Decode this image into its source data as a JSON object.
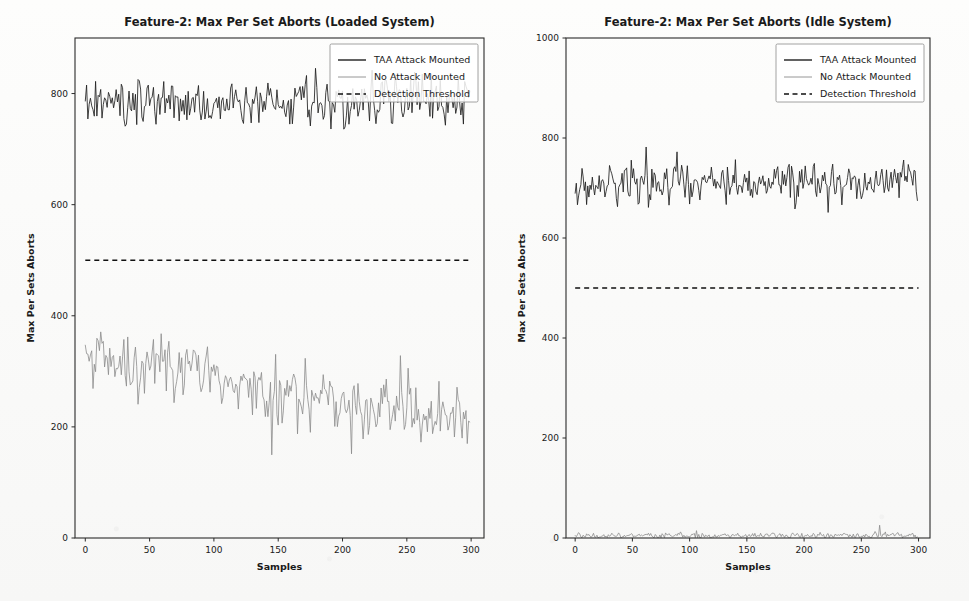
{
  "figure": {
    "width": 969,
    "height": 601,
    "background_color": "#fbfbfa"
  },
  "colors": {
    "taa_attack": "#1f1f1f",
    "no_attack": "#8b8b8b",
    "threshold": "#111111",
    "axis": "#2b2b2b",
    "text": "#1a1a1a"
  },
  "legend": {
    "position": "upper right",
    "entries": [
      {
        "label": "TAA Attack Mounted",
        "style": "solid",
        "color": "#1f1f1f"
      },
      {
        "label": "No Attack Mounted",
        "style": "solid",
        "color": "#8b8b8b"
      },
      {
        "label": "Detection Threshold",
        "style": "dashed",
        "color": "#111111"
      }
    ]
  },
  "chart_data": [
    {
      "type": "line",
      "panel": "left",
      "title": "Feature-2: Max Per Set Aborts (Loaded System)",
      "xlabel": "Samples",
      "ylabel": "Max Per Sets Aborts",
      "xlim": [
        -8,
        310
      ],
      "ylim": [
        0,
        900
      ],
      "xticks": [
        0,
        50,
        100,
        150,
        200,
        250,
        300
      ],
      "yticks": [
        0,
        200,
        400,
        600,
        800
      ],
      "grid": false,
      "n_samples": 300,
      "series": [
        {
          "name": "TAA Attack Mounted",
          "color": "#1f1f1f",
          "style": "solid",
          "mean": 783,
          "noise_amplitude": 34,
          "trend_start": 780,
          "trend_end": 788,
          "min": 688,
          "max": 862,
          "seed": 17
        },
        {
          "name": "No Attack Mounted",
          "color": "#8b8b8b",
          "style": "solid",
          "mean": 268,
          "noise_amplitude": 40,
          "trend_start": 322,
          "trend_end": 207,
          "min": 142,
          "max": 383,
          "seed": 53
        },
        {
          "name": "Detection Threshold",
          "color": "#111111",
          "style": "dashed",
          "constant": 500
        }
      ]
    },
    {
      "type": "line",
      "panel": "right",
      "title": "Feature-2: Max Per Set Aborts (Idle System)",
      "xlabel": "Samples",
      "ylabel": "Max Per Sets Aborts",
      "xlim": [
        -8,
        310
      ],
      "ylim": [
        0,
        1000
      ],
      "xticks": [
        0,
        50,
        100,
        150,
        200,
        250,
        300
      ],
      "yticks": [
        0,
        200,
        400,
        600,
        800,
        1000
      ],
      "grid": false,
      "n_samples": 300,
      "series": [
        {
          "name": "TAA Attack Mounted",
          "color": "#1f1f1f",
          "style": "solid",
          "mean": 713,
          "noise_amplitude": 30,
          "trend_start": 706,
          "trend_end": 719,
          "min": 648,
          "max": 797,
          "seed": 91
        },
        {
          "name": "No Attack Mounted",
          "color": "#8b8b8b",
          "style": "solid",
          "mean": 5,
          "noise_amplitude": 5,
          "trend_start": 5,
          "trend_end": 5,
          "min": 0,
          "max": 28,
          "seed": 7
        },
        {
          "name": "Detection Threshold",
          "color": "#111111",
          "style": "dashed",
          "constant": 500
        }
      ]
    }
  ]
}
